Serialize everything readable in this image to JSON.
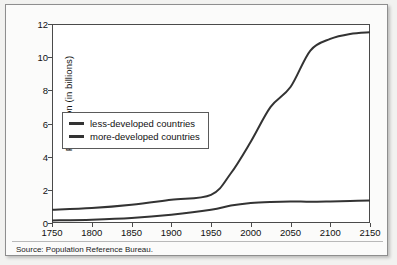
{
  "figure": {
    "source_note": "Source: Population Reference Bureau."
  },
  "chart_data": {
    "type": "line",
    "title": "",
    "xlabel": "",
    "ylabel": "Population (in billions)",
    "xlim": [
      1750,
      2150
    ],
    "ylim": [
      0,
      12
    ],
    "grid": false,
    "legend_position": "upper-left-inside",
    "xticks": [
      "1750",
      "1800",
      "1850",
      "1900",
      "1950",
      "2000",
      "2050",
      "2100",
      "2150"
    ],
    "yticks": [
      "0",
      "2",
      "4",
      "6",
      "8",
      "10",
      "12"
    ],
    "x": [
      1750,
      1800,
      1850,
      1900,
      1950,
      1975,
      2000,
      2025,
      2050,
      2075,
      2100,
      2125,
      2150
    ],
    "series": [
      {
        "name": "less-developed countries",
        "color": "#333333",
        "values": [
          0.8,
          0.9,
          1.1,
          1.4,
          1.7,
          3.0,
          4.9,
          7.0,
          8.2,
          10.4,
          11.1,
          11.4,
          11.5
        ]
      },
      {
        "name": "more-developed countries",
        "color": "#333333",
        "values": [
          0.15,
          0.2,
          0.3,
          0.5,
          0.8,
          1.05,
          1.2,
          1.27,
          1.3,
          1.28,
          1.3,
          1.33,
          1.35
        ]
      }
    ]
  }
}
